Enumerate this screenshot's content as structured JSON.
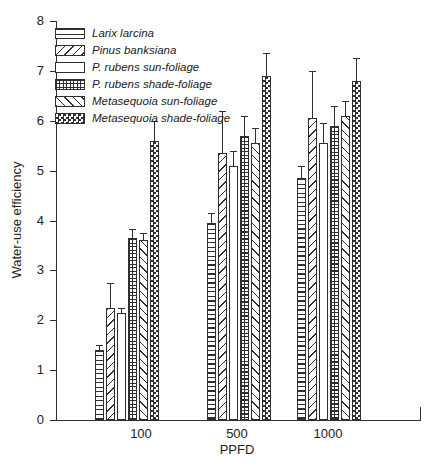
{
  "chart_data": {
    "type": "bar",
    "title": "",
    "xlabel": "PPFD",
    "ylabel": "Water-use efficiency",
    "ylim": [
      0,
      8
    ],
    "yticks": [
      "0",
      "1",
      "2",
      "3",
      "4",
      "5",
      "6",
      "7",
      "8"
    ],
    "categories": [
      "100",
      "500",
      "1000"
    ],
    "series": [
      {
        "name": "Larix larcina",
        "pattern": "horizontal-lines",
        "values": [
          1.4,
          3.95,
          4.85
        ],
        "errors": [
          0.1,
          0.2,
          0.25
        ]
      },
      {
        "name": "Pinus banksiana",
        "pattern": "diagonal-forward",
        "values": [
          2.25,
          5.35,
          6.05
        ],
        "errors": [
          0.5,
          0.85,
          0.95
        ]
      },
      {
        "name": "P. rubens sun-foliage",
        "pattern": "plain",
        "values": [
          2.15,
          5.1,
          5.55
        ],
        "errors": [
          0.1,
          0.3,
          0.4
        ]
      },
      {
        "name": "P. rubens shade-foliage",
        "pattern": "grid",
        "values": [
          3.65,
          5.7,
          5.9
        ],
        "errors": [
          0.17,
          0.4,
          0.4
        ]
      },
      {
        "name": "Metasequoia sun-foliage",
        "pattern": "diagonal-back",
        "values": [
          3.6,
          5.55,
          6.1
        ],
        "errors": [
          0.15,
          0.3,
          0.3
        ]
      },
      {
        "name": "Metasequoia shade-foliage",
        "pattern": "checkerboard",
        "values": [
          5.6,
          6.9,
          6.8
        ],
        "errors": [
          0.4,
          0.45,
          0.45
        ]
      }
    ],
    "legend_position": "top-left",
    "grid": false,
    "error_bars": "upper, capped",
    "colors": {
      "ink": "#2f2f2f",
      "background": "#ffffff",
      "bar_fill": "#ffffff"
    }
  }
}
